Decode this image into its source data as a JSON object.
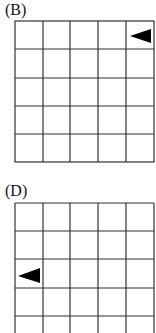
{
  "panels": [
    {
      "label": "(B)",
      "rows": 5,
      "cols": 5,
      "marker": {
        "shape": "triangle",
        "direction": "left",
        "row": 0,
        "col": 4,
        "color": "#000000"
      }
    },
    {
      "label": "(D)",
      "rows": 5,
      "cols": 5,
      "marker": {
        "shape": "triangle",
        "direction": "left",
        "row": 2,
        "col": 0,
        "color": "#000000"
      }
    }
  ],
  "colors": {
    "grid_line": "#333333",
    "background": "#ffffff"
  }
}
